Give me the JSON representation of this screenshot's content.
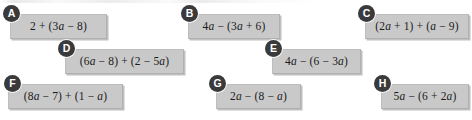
{
  "page": {
    "background_color": "#ffffff",
    "box_fill_color": "#c9c9c9",
    "box_border_color": "#b0b0b0",
    "badge_color": "#3a3a3c",
    "badge_text_color": "#ffffff",
    "expression_text_color": "#1b1b1b"
  },
  "cards": [
    {
      "label": "A",
      "expression": "2 + (3a − 8)",
      "expression_parts": [
        "2",
        "+",
        "(",
        "3",
        "a",
        "−",
        "8",
        ")"
      ],
      "x": 10,
      "y": 14,
      "width": 97,
      "height": 25,
      "badge_x": 3,
      "badge_y": 5
    },
    {
      "label": "B",
      "expression": "4a − (3a + 6)",
      "expression_parts": [
        "4",
        "a",
        "−",
        "(",
        "3",
        "a",
        "+",
        "6",
        ")"
      ],
      "x": 188,
      "y": 14,
      "width": 92,
      "height": 25,
      "badge_x": 181,
      "badge_y": 5
    },
    {
      "label": "C",
      "expression": "(2a + 1) + (a − 9)",
      "expression_parts": [
        "(",
        "2",
        "a",
        "+",
        "1",
        ")",
        "+",
        "(",
        "a",
        "−",
        "9",
        ")"
      ],
      "x": 365,
      "y": 14,
      "width": 104,
      "height": 25,
      "badge_x": 358,
      "badge_y": 5
    },
    {
      "label": "D",
      "expression": "(6a − 8) + (2 − 5a)",
      "expression_parts": [
        "(",
        "6",
        "a",
        "−",
        "8",
        ")",
        "+",
        "(",
        "2",
        "−",
        "5",
        "a",
        ")"
      ],
      "x": 65,
      "y": 49,
      "width": 119,
      "height": 25,
      "badge_x": 58,
      "badge_y": 40
    },
    {
      "label": "E",
      "expression": "4a − (6 − 3a)",
      "expression_parts": [
        "4",
        "a",
        "−",
        "(",
        "6",
        "−",
        "3",
        "a",
        ")"
      ],
      "x": 272,
      "y": 49,
      "width": 89,
      "height": 25,
      "badge_x": 265,
      "badge_y": 40
    },
    {
      "label": "F",
      "expression": "(8a − 7) + (1 − a)",
      "expression_parts": [
        "(",
        "8",
        "a",
        "−",
        "7",
        ")",
        "+",
        "(",
        "1",
        "−",
        "a",
        ")"
      ],
      "x": 8,
      "y": 84,
      "width": 115,
      "height": 25,
      "badge_x": 4,
      "badge_y": 75
    },
    {
      "label": "G",
      "expression": "2a − (8 − a)",
      "expression_parts": [
        "2",
        "a",
        "−",
        "(",
        "8",
        "−",
        "a",
        ")"
      ],
      "x": 216,
      "y": 84,
      "width": 85,
      "height": 25,
      "badge_x": 209,
      "badge_y": 75
    },
    {
      "label": "H",
      "expression": "5a − (6 + 2a)",
      "expression_parts": [
        "5",
        "a",
        "−",
        "(",
        "6",
        "+",
        "2",
        "a",
        ")"
      ],
      "x": 381,
      "y": 84,
      "width": 88,
      "height": 25,
      "badge_x": 374,
      "badge_y": 75
    }
  ]
}
